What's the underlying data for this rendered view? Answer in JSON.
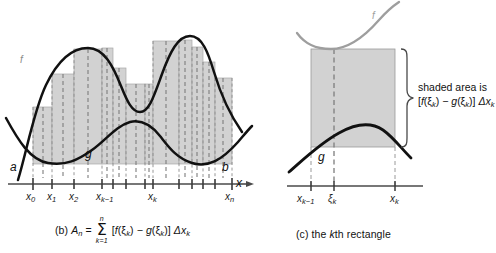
{
  "figure": {
    "panels": [
      {
        "id": "panel-b",
        "caption_prefix": "(b)",
        "caption_A": "A",
        "caption_A_sub": "n",
        "caption_eq": "=",
        "sum_upper": "n",
        "sum_symbol": "Σ",
        "sum_lower": "k=1",
        "caption_body_open": "[",
        "caption_f": "f",
        "caption_xi_f": "(ξ",
        "caption_xi_f_sub": "k",
        "caption_xi_f_close": ")",
        "caption_minus": "−",
        "caption_g": "g",
        "caption_xi_g": "(ξ",
        "caption_xi_g_sub": "k",
        "caption_xi_g_close": ")",
        "caption_body_close": "]",
        "caption_delta": "Δx",
        "caption_delta_sub": "k",
        "curve_labels": {
          "f": "f",
          "g": "g"
        },
        "endpoint_labels": {
          "a": "a",
          "b": "b"
        },
        "axis_label": "x",
        "tick_labels": [
          {
            "text": "x",
            "sub": "0"
          },
          {
            "text": "x",
            "sub": "1"
          },
          {
            "text": "x",
            "sub": "2"
          },
          {
            "text": "x",
            "sub": "k−1"
          },
          {
            "text": "x",
            "sub": "k"
          },
          {
            "text": "x",
            "sub": "n"
          }
        ]
      },
      {
        "id": "panel-c",
        "caption_prefix": "(c) the ",
        "caption_k": "k",
        "caption_suffix": "th rectangle",
        "curve_labels": {
          "f": "f",
          "g": "g"
        },
        "annotation_line1": "shaded area is",
        "annotation_line2_open": "[",
        "annotation_f": "f",
        "annotation_xi_f": "(ξ",
        "annotation_xi_f_sub": "k",
        "annotation_xi_f_close": ")",
        "annotation_minus": "−",
        "annotation_g": "g",
        "annotation_xi_g": "(ξ",
        "annotation_xi_g_sub": "k",
        "annotation_xi_g_close": ")",
        "annotation_close": "]",
        "annotation_delta": "Δx",
        "annotation_delta_sub": "k",
        "tick_labels": [
          {
            "text": "x",
            "sub": "k−1"
          },
          {
            "text": "ξ",
            "sub": "k"
          },
          {
            "text": "x",
            "sub": "k"
          }
        ]
      }
    ],
    "colors": {
      "shade": "#d2d2d2",
      "shade_stroke": "#9a9a9a",
      "curve": "#111111",
      "curve_light": "#9e9e9e",
      "axis": "#4a4a4a",
      "dashed": "#7d7d7d"
    }
  }
}
